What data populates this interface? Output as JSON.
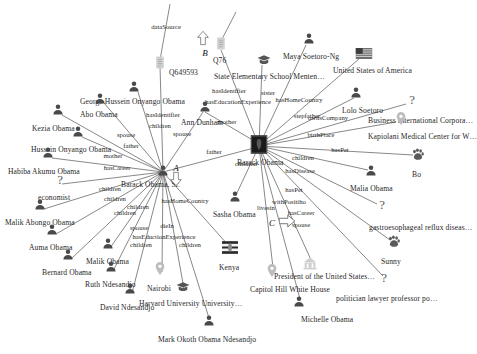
{
  "graph": {
    "type": "knowledge-graph",
    "center_entity": "Barack Obama",
    "markers": [
      {
        "id": "marker-a",
        "label": "A",
        "x": 176,
        "y": 168,
        "arrow": "down",
        "arrow_x": 176,
        "arrow_y": 181
      },
      {
        "id": "marker-b",
        "label": "B",
        "x": 205,
        "y": 53,
        "arrow": "up",
        "arrow_x": 203,
        "arrow_y": 40
      },
      {
        "id": "marker-c",
        "label": "C",
        "x": 272,
        "y": 223,
        "arrow": "right",
        "arrow_x": 287,
        "arrow_y": 223
      }
    ],
    "nodes": [
      {
        "id": "barack-obama",
        "label": "Barack Obama",
        "icon": "portrait-thumbnail",
        "x": 259,
        "y": 146,
        "lx": 237,
        "ly": 158
      },
      {
        "id": "barack-obama-sr",
        "label": "Barack Obama, Sr.",
        "icon": "person-icon",
        "x": 163,
        "y": 172,
        "lx": 121,
        "ly": 180
      },
      {
        "id": "ann-dunham",
        "label": "Ann Dunham",
        "icon": "person-icon",
        "x": 205,
        "y": 108,
        "lx": 181,
        "ly": 118
      },
      {
        "id": "george-hussein-onyango-obama",
        "label": "George Hussein Onyango Obama",
        "icon": "person-icon",
        "x": 134,
        "y": 88,
        "lx": 80,
        "ly": 97
      },
      {
        "id": "abo-obama",
        "label": "Abo Obama",
        "icon": "person-icon",
        "x": 100,
        "y": 100,
        "lx": 80,
        "ly": 110
      },
      {
        "id": "kezia-obama",
        "label": "Kezia Obama",
        "icon": "person-icon",
        "x": 58,
        "y": 111,
        "lx": 32,
        "ly": 124
      },
      {
        "id": "hussein-onyango-obama",
        "label": "Hussein Onyango Obama",
        "icon": "person-icon",
        "x": 78,
        "y": 133,
        "lx": 31,
        "ly": 145
      },
      {
        "id": "habiba-akumu-obama",
        "label": "Habiba Akumu Obama",
        "icon": "person-icon",
        "x": 48,
        "y": 154,
        "lx": 8,
        "ly": 167
      },
      {
        "id": "economist",
        "label": "economist",
        "icon": "question-icon",
        "x": 60,
        "y": 181,
        "lx": 38,
        "ly": 193
      },
      {
        "id": "malik-abongo-obama",
        "label": "Malik Abongo Obama",
        "icon": "person-icon",
        "x": 40,
        "y": 206,
        "lx": 5,
        "ly": 218
      },
      {
        "id": "auma-obama",
        "label": "Auma Obama",
        "icon": "person-icon",
        "x": 52,
        "y": 231,
        "lx": 29,
        "ly": 243
      },
      {
        "id": "bernard-obama",
        "label": "Bernard Obama",
        "icon": "person-icon",
        "x": 68,
        "y": 256,
        "lx": 42,
        "ly": 268
      },
      {
        "id": "malik-obama",
        "label": "Malik Obama",
        "icon": "person-icon",
        "x": 108,
        "y": 245,
        "lx": 86,
        "ly": 257
      },
      {
        "id": "ruth-ndesandjo",
        "label": "Ruth Ndesandjo",
        "icon": "person-icon",
        "x": 111,
        "y": 268,
        "lx": 85,
        "ly": 280
      },
      {
        "id": "david-ndesandjo",
        "label": "David Ndesandjo",
        "icon": "person-icon",
        "x": 130,
        "y": 290,
        "lx": 100,
        "ly": 303
      },
      {
        "id": "mark-okoth-obama-ndesandjo",
        "label": "Mark Okoth Obama Ndesandjo",
        "icon": "person-icon",
        "x": 209,
        "y": 322,
        "lx": 158,
        "ly": 335
      },
      {
        "id": "nairobi",
        "label": "Nairobi",
        "icon": "location-pin-icon",
        "x": 160,
        "y": 270,
        "lx": 147,
        "ly": 284
      },
      {
        "id": "harvard-university",
        "label": "Harvard University University…",
        "icon": "graduation-cap-icon",
        "x": 183,
        "y": 287,
        "lx": 139,
        "ly": 299
      },
      {
        "id": "q649593",
        "label": "Q649593",
        "icon": "document-icon",
        "x": 160,
        "y": 64,
        "lx": 169,
        "ly": 68
      },
      {
        "id": "q76",
        "label": "Q76",
        "icon": "document-icon",
        "x": 221,
        "y": 45,
        "lx": 213,
        "ly": 56
      },
      {
        "id": "state-elementary-school",
        "label": "State Elementary School Menten…",
        "icon": "graduation-cap-icon",
        "x": 264,
        "y": 60,
        "lx": 214,
        "ly": 72
      },
      {
        "id": "maya-soetoro-ng",
        "label": "Maya Soetoro-Ng",
        "icon": "person-icon",
        "x": 309,
        "y": 40,
        "lx": 283,
        "ly": 52
      },
      {
        "id": "united-states-of-america",
        "label": "United States of America",
        "icon": "us-flag-icon",
        "x": 364,
        "y": 54,
        "lx": 333,
        "ly": 66
      },
      {
        "id": "lolo-soetoro",
        "label": "Lolo Soetoro",
        "icon": "person-icon",
        "x": 356,
        "y": 94,
        "lx": 342,
        "ly": 106
      },
      {
        "id": "business-international",
        "label": "Business International Corpora…",
        "icon": "question-icon",
        "x": 412,
        "y": 101,
        "lx": 368,
        "ly": 116
      },
      {
        "id": "kapiolani-medical-center",
        "label": "Kapiolani Medical Center for W…",
        "icon": "location-pin-icon",
        "x": 401,
        "y": 120,
        "lx": 368,
        "ly": 132
      },
      {
        "id": "bo",
        "label": "Bo",
        "icon": "paw-icon",
        "x": 418,
        "y": 156,
        "lx": 412,
        "ly": 170
      },
      {
        "id": "malia-obama",
        "label": "Malia Obama",
        "icon": "person-icon",
        "x": 371,
        "y": 172,
        "lx": 350,
        "ly": 184
      },
      {
        "id": "gastroesophageal",
        "label": "gastroesophageal reflux diseas…",
        "icon": "question-icon",
        "x": 382,
        "y": 206,
        "lx": 369,
        "ly": 223
      },
      {
        "id": "sunny",
        "label": "Sunny",
        "icon": "paw-icon",
        "x": 394,
        "y": 243,
        "lx": 381,
        "ly": 257
      },
      {
        "id": "president-of-the-us",
        "label": "President of the United States…",
        "icon": "institution-icon",
        "x": 310,
        "y": 265,
        "lx": 274,
        "ly": 272
      },
      {
        "id": "politician-lawyer",
        "label": "politician lawyer professor po…",
        "icon": "question-icon",
        "x": 384,
        "y": 279,
        "lx": 336,
        "ly": 294
      },
      {
        "id": "michelle-obama",
        "label": "Michelle Obama",
        "icon": "person-icon",
        "x": 299,
        "y": 303,
        "lx": 301,
        "ly": 315
      },
      {
        "id": "capitol-hill-white-house",
        "label": "Capitol Hill White House",
        "icon": "location-pin-icon",
        "x": 272,
        "y": 272,
        "lx": 250,
        "ly": 285
      },
      {
        "id": "kenya",
        "label": "Kenya",
        "icon": "kenya-flag-icon",
        "x": 230,
        "y": 249,
        "lx": 219,
        "ly": 263
      },
      {
        "id": "sasha-obama",
        "label": "Sasha Obama",
        "icon": "person-icon",
        "x": 235,
        "y": 198,
        "lx": 213,
        "ly": 210
      }
    ],
    "edges": [
      {
        "from": "barack-obama-sr",
        "to": "q649593",
        "label": "hasIdentifier",
        "lx": 163,
        "ly": 114
      },
      {
        "from": "barack-obama-sr",
        "to": "george-hussein-onyango-obama",
        "label": "children",
        "lx": 160,
        "ly": 125
      },
      {
        "from": "barack-obama-sr",
        "to": "abo-obama",
        "label": "spouse",
        "lx": 126,
        "ly": 134
      },
      {
        "from": "barack-obama-sr",
        "to": "kezia-obama",
        "label": "father",
        "lx": 131,
        "ly": 145
      },
      {
        "from": "barack-obama-sr",
        "to": "hussein-onyango-obama",
        "label": "mother",
        "lx": 113,
        "ly": 155
      },
      {
        "from": "barack-obama-sr",
        "to": "habiba-akumu-obama",
        "label": "hasCareer",
        "lx": 117,
        "ly": 167
      },
      {
        "from": "barack-obama-sr",
        "to": "economist",
        "label": "children",
        "lx": 110,
        "ly": 188
      },
      {
        "from": "barack-obama-sr",
        "to": "malik-abongo-obama",
        "label": "children",
        "lx": 115,
        "ly": 198
      },
      {
        "from": "barack-obama-sr",
        "to": "auma-obama",
        "label": "children",
        "lx": 138,
        "ly": 206
      },
      {
        "from": "barack-obama-sr",
        "to": "bernard-obama",
        "label": "children",
        "lx": 125,
        "ly": 212
      },
      {
        "from": "barack-obama-sr",
        "to": "malik-obama",
        "label": "spouse",
        "lx": 139,
        "ly": 227
      },
      {
        "from": "barack-obama-sr",
        "to": "ruth-ndesandjo",
        "label": "dieIn",
        "lx": 167,
        "ly": 225
      },
      {
        "from": "barack-obama-sr",
        "to": "harvard-university",
        "label": "hasEductionExperience",
        "lx": 164,
        "ly": 236
      },
      {
        "from": "barack-obama-sr",
        "to": "david-ndesandjo",
        "label": "children",
        "lx": 141,
        "ly": 244
      },
      {
        "from": "barack-obama-sr",
        "to": "mark-okoth-obama-ndesandjo",
        "label": "children",
        "lx": 190,
        "ly": 244
      },
      {
        "from": "barack-obama-sr",
        "to": "kenya",
        "label": "hasHomeCountry",
        "lx": 185,
        "ly": 200
      },
      {
        "from": "ann-dunham",
        "to": "barack-obama",
        "label": "mother",
        "lx": 227,
        "ly": 121
      },
      {
        "from": "barack-obama-sr",
        "to": "ann-dunham",
        "label": "spouse",
        "lx": 182,
        "ly": 133
      },
      {
        "from": "barack-obama",
        "to": "barack-obama-sr",
        "label": "father",
        "lx": 214,
        "ly": 151
      },
      {
        "from": "barack-obama",
        "to": "q76",
        "label": "hasIdentifier",
        "lx": 229,
        "ly": 90
      },
      {
        "from": "barack-obama",
        "to": "state-elementary-school",
        "label": "hasEducationExperience",
        "lx": 238,
        "ly": 101
      },
      {
        "from": "barack-obama",
        "to": "maya-soetoro-ng",
        "label": "sister",
        "lx": 268,
        "ly": 92
      },
      {
        "from": "barack-obama",
        "to": "united-states-of-america",
        "label": "hasHomeCountry",
        "lx": 299,
        "ly": 99
      },
      {
        "from": "barack-obama",
        "to": "lolo-soetoro",
        "label": "stepfather",
        "lx": 307,
        "ly": 115
      },
      {
        "from": "barack-obama",
        "to": "business-international",
        "label": "ownsCompany",
        "lx": 328,
        "ly": 117
      },
      {
        "from": "barack-obama",
        "to": "kapiolani-medical-center",
        "label": "birthPlace",
        "lx": 321,
        "ly": 134
      },
      {
        "from": "barack-obama",
        "to": "bo",
        "label": "hasPet",
        "lx": 340,
        "ly": 149
      },
      {
        "from": "barack-obama",
        "to": "malia-obama",
        "label": "children",
        "lx": 303,
        "ly": 157
      },
      {
        "from": "barack-obama",
        "to": "gastroesophageal",
        "label": "hasDisease",
        "lx": 300,
        "ly": 170
      },
      {
        "from": "barack-obama",
        "to": "sunny",
        "label": "hasPet",
        "lx": 294,
        "ly": 189
      },
      {
        "from": "barack-obama",
        "to": "president-of-the-us",
        "label": "withPositiho",
        "lx": 289,
        "ly": 201
      },
      {
        "from": "barack-obama",
        "to": "politician-lawyer",
        "label": "hasCareer",
        "lx": 301,
        "ly": 212
      },
      {
        "from": "barack-obama",
        "to": "michelle-obama",
        "label": "spouse",
        "lx": 301,
        "ly": 224
      },
      {
        "from": "barack-obama",
        "to": "capitol-hill-white-house",
        "label": "livesin",
        "lx": 266,
        "ly": 207
      },
      {
        "from": "barack-obama",
        "to": "sasha-obama",
        "label": "children",
        "lx": 246,
        "ly": 163
      },
      {
        "from": "q649593",
        "to": "datasource",
        "label": "dataSource",
        "lx": 166,
        "ly": 26
      }
    ],
    "lines": [
      {
        "x1": 163,
        "y1": 172,
        "x2": 160,
        "y2": 66
      },
      {
        "x1": 163,
        "y1": 172,
        "x2": 138,
        "y2": 92
      },
      {
        "x1": 163,
        "y1": 172,
        "x2": 104,
        "y2": 103
      },
      {
        "x1": 163,
        "y1": 172,
        "x2": 62,
        "y2": 115
      },
      {
        "x1": 163,
        "y1": 172,
        "x2": 82,
        "y2": 137
      },
      {
        "x1": 163,
        "y1": 172,
        "x2": 52,
        "y2": 158
      },
      {
        "x1": 163,
        "y1": 172,
        "x2": 62,
        "y2": 184
      },
      {
        "x1": 163,
        "y1": 172,
        "x2": 44,
        "y2": 209
      },
      {
        "x1": 163,
        "y1": 172,
        "x2": 56,
        "y2": 234
      },
      {
        "x1": 163,
        "y1": 172,
        "x2": 72,
        "y2": 258
      },
      {
        "x1": 163,
        "y1": 172,
        "x2": 110,
        "y2": 248
      },
      {
        "x1": 163,
        "y1": 172,
        "x2": 113,
        "y2": 271
      },
      {
        "x1": 163,
        "y1": 172,
        "x2": 132,
        "y2": 293
      },
      {
        "x1": 163,
        "y1": 172,
        "x2": 162,
        "y2": 272
      },
      {
        "x1": 163,
        "y1": 172,
        "x2": 184,
        "y2": 289
      },
      {
        "x1": 163,
        "y1": 172,
        "x2": 209,
        "y2": 318
      },
      {
        "x1": 163,
        "y1": 172,
        "x2": 229,
        "y2": 246
      },
      {
        "x1": 163,
        "y1": 172,
        "x2": 203,
        "y2": 112
      },
      {
        "x1": 163,
        "y1": 172,
        "x2": 254,
        "y2": 148
      },
      {
        "x1": 205,
        "y1": 112,
        "x2": 256,
        "y2": 142
      },
      {
        "x1": 259,
        "y1": 146,
        "x2": 221,
        "y2": 50
      },
      {
        "x1": 259,
        "y1": 146,
        "x2": 262,
        "y2": 65
      },
      {
        "x1": 259,
        "y1": 146,
        "x2": 306,
        "y2": 45
      },
      {
        "x1": 259,
        "y1": 146,
        "x2": 360,
        "y2": 58
      },
      {
        "x1": 259,
        "y1": 146,
        "x2": 354,
        "y2": 98
      },
      {
        "x1": 259,
        "y1": 146,
        "x2": 406,
        "y2": 104
      },
      {
        "x1": 259,
        "y1": 146,
        "x2": 396,
        "y2": 122
      },
      {
        "x1": 259,
        "y1": 146,
        "x2": 413,
        "y2": 155
      },
      {
        "x1": 259,
        "y1": 146,
        "x2": 368,
        "y2": 170
      },
      {
        "x1": 259,
        "y1": 146,
        "x2": 377,
        "y2": 204
      },
      {
        "x1": 259,
        "y1": 146,
        "x2": 390,
        "y2": 240
      },
      {
        "x1": 259,
        "y1": 146,
        "x2": 383,
        "y2": 276
      },
      {
        "x1": 259,
        "y1": 146,
        "x2": 312,
        "y2": 262
      },
      {
        "x1": 259,
        "y1": 146,
        "x2": 300,
        "y2": 299
      },
      {
        "x1": 259,
        "y1": 146,
        "x2": 273,
        "y2": 268
      },
      {
        "x1": 259,
        "y1": 146,
        "x2": 236,
        "y2": 195
      },
      {
        "x1": 160,
        "y1": 60,
        "x2": 170,
        "y2": 4
      },
      {
        "x1": 221,
        "y1": 41,
        "x2": 236,
        "y2": 12
      }
    ]
  }
}
